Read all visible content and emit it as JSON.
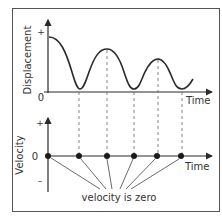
{
  "top_graph": {
    "y_label": "Displacement",
    "x_label": "Time",
    "plus": "+",
    "origin": "0"
  },
  "bottom_graph": {
    "y_label": "Velocity",
    "x_label": "Time",
    "plus": "+",
    "minus": "–",
    "zero": "0"
  },
  "annotation": "velocity is zero",
  "colors": {
    "stroke": "#2a2a2a",
    "frame": "#555555",
    "dash": "#666666"
  }
}
